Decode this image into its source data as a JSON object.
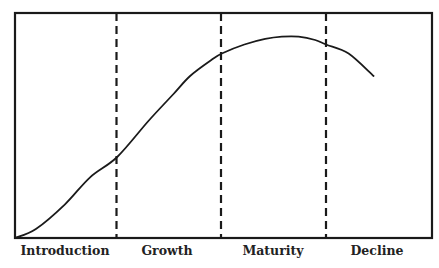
{
  "chart_data": {
    "type": "line",
    "title": "",
    "xlabel": "",
    "ylabel": "",
    "grid": false,
    "legend": null,
    "stages": [
      "Introduction",
      "Growth",
      "Maturity",
      "Decline"
    ],
    "stage_boundaries_relative": [
      0.245,
      0.496,
      0.746
    ],
    "series": [
      {
        "name": "Product life cycle",
        "x": [
          0.0,
          0.05,
          0.12,
          0.18,
          0.245,
          0.32,
          0.38,
          0.42,
          0.47,
          0.496,
          0.55,
          0.6,
          0.64,
          0.68,
          0.72,
          0.746,
          0.8,
          0.86
        ],
        "y": [
          0.0,
          0.04,
          0.15,
          0.27,
          0.36,
          0.52,
          0.64,
          0.72,
          0.79,
          0.82,
          0.86,
          0.885,
          0.895,
          0.895,
          0.88,
          0.86,
          0.82,
          0.72
        ]
      }
    ],
    "colors": {
      "line": "#1a1a1a",
      "frame": "#1a1a1a",
      "divider": "#1a1a1a",
      "background": "#ffffff"
    }
  },
  "labels": {
    "introduction": "Introduction",
    "growth": "Growth",
    "maturity": "Maturity",
    "decline": "Decline"
  }
}
